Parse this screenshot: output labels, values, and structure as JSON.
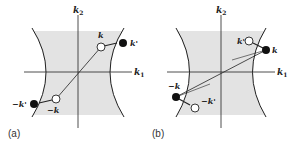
{
  "figure": {
    "panels": [
      {
        "id": "a",
        "caption": "(a)",
        "axis_x_label": "k",
        "axis_x_sub": "1",
        "axis_y_label": "k",
        "axis_y_sub": "2",
        "points": {
          "k": "k",
          "k_prime": "k'",
          "neg_k": "−k",
          "neg_k_prime": "−k'"
        }
      },
      {
        "id": "b",
        "caption": "(b)",
        "axis_x_label": "k",
        "axis_x_sub": "1",
        "axis_y_label": "k",
        "axis_y_sub": "2",
        "points": {
          "k": "k",
          "k_prime": "k'",
          "neg_k": "−k",
          "neg_k_prime": "−k'"
        }
      }
    ],
    "colors": {
      "shade": "#e3e3e3",
      "line": "#222222",
      "filled_dot": "#111111",
      "open_dot": "#ffffff"
    }
  }
}
